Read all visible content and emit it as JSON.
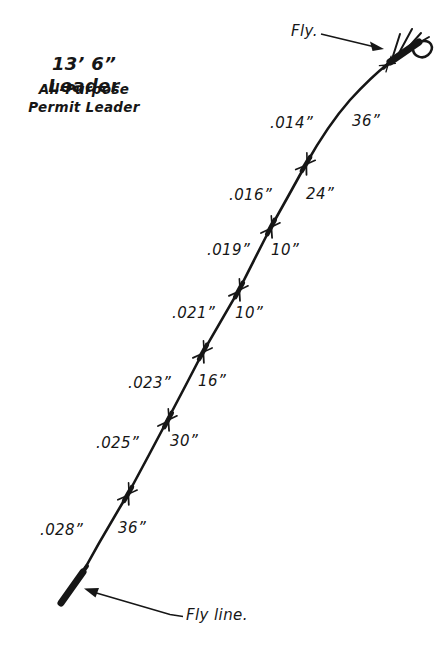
{
  "title": {
    "line1": "13’ 6” Leader",
    "line2": "All-Purpose",
    "line3": "Permit Leader"
  },
  "labels": {
    "fly": "Fly.",
    "fly_line": "Fly line."
  },
  "sections": [
    {
      "diameter": ".014”",
      "length": "36”"
    },
    {
      "diameter": ".016”",
      "length": "24”"
    },
    {
      "diameter": ".019”",
      "length": "10”"
    },
    {
      "diameter": ".021”",
      "length": "10”"
    },
    {
      "diameter": ".023”",
      "length": "16”"
    },
    {
      "diameter": ".025”",
      "length": "30”"
    },
    {
      "diameter": ".028”",
      "length": "36”"
    }
  ],
  "colors": {
    "ink": "#161616",
    "background": "#ffffff"
  },
  "diagram": {
    "total_sections": "7",
    "knot_count": "6"
  }
}
